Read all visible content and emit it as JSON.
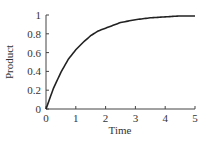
{
  "chart_data": {
    "type": "line",
    "title": "",
    "xlabel": "Time",
    "ylabel": "Product",
    "xlim": [
      0,
      5
    ],
    "ylim": [
      0,
      1
    ],
    "x_ticks": [
      "0",
      "1",
      "2",
      "3",
      "4",
      "5"
    ],
    "y_ticks": [
      "0",
      "0.2",
      "0.4",
      "0.6",
      "0.8",
      "1"
    ],
    "grid": false,
    "legend": null,
    "series": [
      {
        "name": "Product",
        "x": [
          0,
          0.25,
          0.5,
          0.75,
          1,
          1.25,
          1.5,
          1.75,
          2,
          2.5,
          3,
          3.5,
          4,
          4.5,
          5
        ],
        "values": [
          0,
          0.22,
          0.39,
          0.53,
          0.63,
          0.71,
          0.78,
          0.83,
          0.86,
          0.92,
          0.95,
          0.97,
          0.98,
          0.99,
          0.99
        ],
        "color": "#222222"
      }
    ]
  }
}
